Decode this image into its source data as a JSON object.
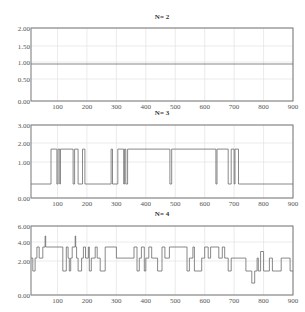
{
  "chart_data": [
    {
      "type": "line",
      "title": "N= 2",
      "xlabel": "",
      "ylabel": "",
      "xlim": [
        10,
        900
      ],
      "ylim": [
        0,
        2
      ],
      "grid": true,
      "x_ticks": [
        100,
        200,
        300,
        400,
        500,
        600,
        700,
        800,
        900
      ],
      "x_tick_labels": [
        "100",
        "200",
        "300",
        "400",
        "500",
        "600",
        "700",
        "800",
        "900"
      ],
      "y_ticks": [
        0,
        0.5,
        1,
        1.5,
        2
      ],
      "y_tick_labels": [
        "0.00",
        "0.50",
        "1.00",
        "1.50",
        "2.00"
      ],
      "y_tick_px": [
        101,
        79,
        62,
        46,
        28
      ],
      "frame_px": {
        "left": 31,
        "right": 293,
        "top": 28,
        "bottom": 101,
        "title_y": 19
      },
      "series": [
        {
          "name": "N=2",
          "x": [
            10,
            900
          ],
          "y": [
            0.94,
            0.94
          ]
        }
      ]
    },
    {
      "type": "line",
      "title": "N= 3",
      "xlabel": "",
      "ylabel": "",
      "xlim": [
        10,
        900
      ],
      "ylim": [
        0,
        3
      ],
      "grid": true,
      "x_ticks": [
        100,
        200,
        300,
        400,
        500,
        600,
        700,
        800,
        900
      ],
      "x_tick_labels": [
        "100",
        "200",
        "300",
        "400",
        "500",
        "600",
        "700",
        "800",
        "900"
      ],
      "y_ticks": [
        0,
        1,
        2,
        3
      ],
      "y_tick_labels": [
        "0.00",
        "1.00",
        "2.00",
        "3.00"
      ],
      "y_tick_px": [
        198,
        162,
        143,
        125
      ],
      "frame_px": {
        "left": 31,
        "right": 293,
        "top": 125,
        "bottom": 198,
        "title_y": 115
      },
      "series": [
        {
          "name": "N=3",
          "x": [
            10,
            78,
            78,
            98,
            98,
            102,
            102,
            108,
            108,
            110,
            110,
            153,
            153,
            158,
            158,
            170,
            170,
            185,
            185,
            193,
            193,
            282,
            282,
            287,
            287,
            305,
            305,
            325,
            325,
            328,
            328,
            332,
            332,
            338,
            338,
            482,
            482,
            488,
            488,
            638,
            638,
            642,
            642,
            680,
            680,
            690,
            690,
            700,
            700,
            703,
            703,
            715,
            715,
            718,
            718,
            900
          ],
          "y": [
            0.39,
            0.39,
            1.68,
            1.68,
            0.39,
            0.39,
            1.68,
            1.68,
            0.39,
            0.39,
            1.68,
            1.68,
            0.39,
            0.39,
            1.68,
            1.68,
            0.39,
            0.39,
            1.68,
            1.68,
            0.39,
            0.39,
            1.68,
            1.68,
            0.39,
            0.39,
            1.68,
            1.68,
            0.39,
            0.39,
            1.68,
            1.68,
            0.39,
            0.39,
            1.68,
            1.68,
            0.39,
            0.39,
            1.68,
            1.68,
            0.39,
            0.39,
            1.68,
            1.68,
            0.39,
            0.39,
            1.68,
            1.68,
            0.39,
            0.39,
            1.68,
            1.68,
            0.39,
            0.39,
            0.39,
            0.39
          ]
        }
      ]
    },
    {
      "type": "line",
      "title": "N= 4",
      "xlabel": "",
      "ylabel": "",
      "xlim": [
        10,
        900
      ],
      "ylim": [
        0,
        6
      ],
      "grid": true,
      "x_ticks": [
        100,
        200,
        300,
        400,
        500,
        600,
        700,
        800,
        900
      ],
      "x_tick_labels": [
        "100",
        "200",
        "300",
        "400",
        "500",
        "600",
        "700",
        "800",
        "900"
      ],
      "y_ticks": [
        0,
        2,
        4,
        6
      ],
      "y_tick_labels": [
        "0.00",
        "2.00",
        "4.00",
        "6.00"
      ],
      "y_tick_px": [
        295,
        261,
        242,
        226
      ],
      "frame_px": {
        "left": 31,
        "right": 293,
        "top": 226,
        "bottom": 295,
        "title_y": 216
      },
      "series": [
        {
          "name": "N=4",
          "x": [
            10,
            16,
            16,
            24,
            24,
            30,
            30,
            38,
            38,
            50,
            50,
            58,
            58,
            60,
            60,
            62,
            62,
            118,
            118,
            130,
            130,
            136,
            136,
            140,
            140,
            145,
            145,
            150,
            150,
            160,
            160,
            162,
            162,
            165,
            165,
            170,
            170,
            182,
            182,
            188,
            188,
            195,
            195,
            205,
            205,
            208,
            208,
            215,
            215,
            228,
            228,
            235,
            235,
            245,
            245,
            262,
            262,
            300,
            300,
            315,
            315,
            360,
            360,
            370,
            370,
            378,
            378,
            385,
            385,
            395,
            395,
            400,
            400,
            410,
            410,
            420,
            420,
            440,
            440,
            455,
            455,
            465,
            465,
            480,
            480,
            540,
            540,
            548,
            548,
            560,
            560,
            565,
            565,
            590,
            590,
            600,
            600,
            612,
            612,
            620,
            620,
            648,
            648,
            660,
            660,
            668,
            668,
            680,
            680,
            690,
            690,
            740,
            740,
            760,
            760,
            770,
            770,
            778,
            778,
            782,
            782,
            790,
            790,
            800,
            800,
            820,
            820,
            830,
            830,
            840,
            840,
            860,
            860,
            890,
            890,
            900
          ],
          "y": [
            2.3,
            2.3,
            1.41,
            1.41,
            2.3,
            2.3,
            3.47,
            3.47,
            2.3,
            2.3,
            3.47,
            3.47,
            4.75,
            4.75,
            3.47,
            3.47,
            3.47,
            3.47,
            1.41,
            1.41,
            3.47,
            3.47,
            2.3,
            2.3,
            1.41,
            1.41,
            2.3,
            2.3,
            3.47,
            3.47,
            4.75,
            4.75,
            3.47,
            3.47,
            2.3,
            2.3,
            1.41,
            1.41,
            2.3,
            2.3,
            3.47,
            3.47,
            2.3,
            2.3,
            3.47,
            3.47,
            1.41,
            1.41,
            2.3,
            2.3,
            3.47,
            3.47,
            2.3,
            2.3,
            1.41,
            1.41,
            3.47,
            3.47,
            2.3,
            2.3,
            2.3,
            2.3,
            3.47,
            3.47,
            1.41,
            1.41,
            2.3,
            2.3,
            3.47,
            3.47,
            1.41,
            1.41,
            2.3,
            2.3,
            3.47,
            3.47,
            2.3,
            2.3,
            1.41,
            1.41,
            3.47,
            3.47,
            2.3,
            2.3,
            3.47,
            3.47,
            1.41,
            1.41,
            2.3,
            2.3,
            3.47,
            3.47,
            1.41,
            1.41,
            2.3,
            2.3,
            3.47,
            3.47,
            2.3,
            2.3,
            3.47,
            3.47,
            2.3,
            2.3,
            3.47,
            3.47,
            2.3,
            2.3,
            1.41,
            1.41,
            2.3,
            2.3,
            1.41,
            1.41,
            0.7,
            0.7,
            1.41,
            1.41,
            2.3,
            2.3,
            1.41,
            1.41,
            3.0,
            3.0,
            1.41,
            1.41,
            2.3,
            2.3,
            1.41,
            1.41,
            1.41,
            1.41,
            2.3,
            2.3,
            1.41,
            1.41
          ]
        }
      ]
    }
  ]
}
